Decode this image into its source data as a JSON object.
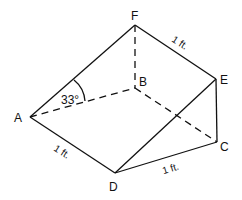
{
  "figure": {
    "type": "triangular prism diagram",
    "vertices": [
      "A",
      "B",
      "C",
      "D",
      "E",
      "F"
    ],
    "labels": {
      "A": "A",
      "B": "B",
      "C": "C",
      "D": "D",
      "E": "E",
      "F": "F"
    },
    "angle_label": "33°",
    "dimensions": {
      "FE": "1 ft.",
      "AD": "1 ft.",
      "DC": "1 ft."
    },
    "solid_edges": [
      "AF",
      "FE",
      "EC",
      "AD",
      "DC",
      "DE"
    ],
    "dashed_edges": [
      "AB",
      "FB",
      "BC"
    ],
    "line_color": "#111111"
  }
}
